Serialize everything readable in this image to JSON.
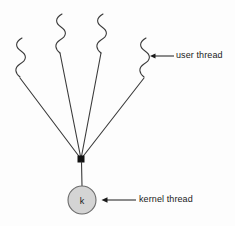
{
  "diagram": {
    "background_color": "#fdfdfd",
    "stroke_color": "#3a3a3a",
    "annotations": {
      "user_thread_label": "user thread",
      "kernel_thread_label": "kernel thread"
    },
    "kernel_node": {
      "letter": "k",
      "fill_color": "#d4d4d4",
      "border_color": "#6b6b6b",
      "cx": 82,
      "cy": 200,
      "r": 14
    },
    "junction": {
      "x": 81,
      "y": 159,
      "size": 7,
      "color": "#111111"
    },
    "user_threads": [
      {
        "name": "user-thread-1",
        "squiggle_x": 19,
        "squiggle_top": 38,
        "squiggle_bottom": 76,
        "line_start_x": 20,
        "line_start_y": 78
      },
      {
        "name": "user-thread-2",
        "squiggle_x": 59,
        "squiggle_top": 14,
        "squiggle_bottom": 51,
        "line_start_x": 60,
        "line_start_y": 53
      },
      {
        "name": "user-thread-3",
        "squiggle_x": 100,
        "squiggle_top": 14,
        "squiggle_bottom": 51,
        "line_start_x": 101,
        "line_start_y": 53
      },
      {
        "name": "user-thread-4",
        "squiggle_x": 143,
        "squiggle_top": 38,
        "squiggle_bottom": 76,
        "line_start_x": 144,
        "line_start_y": 78
      }
    ],
    "arrows": {
      "user_thread_arrow": {
        "tip_x": 150,
        "tip_y": 56,
        "tail_x": 174,
        "tail_y": 56
      },
      "kernel_thread_arrow": {
        "tip_x": 102,
        "tip_y": 200,
        "tail_x": 136,
        "tail_y": 200
      }
    }
  }
}
